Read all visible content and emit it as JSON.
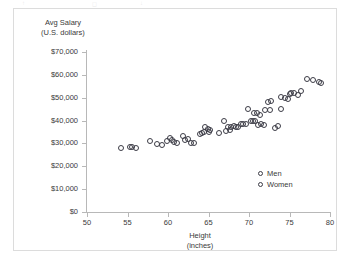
{
  "chart_data": {
    "type": "scatter",
    "title": "",
    "xlabel": "Height (inches)",
    "ylabel": "Avg Salary (U.S. dollars)",
    "xlabel_lines": [
      "Height",
      "(inches)"
    ],
    "ylabel_lines": [
      "Avg Salary",
      "(U.S. dollars)"
    ],
    "xlim": [
      50,
      80
    ],
    "ylim": [
      0,
      70000
    ],
    "xticks": [
      50,
      55,
      60,
      65,
      70,
      75,
      80
    ],
    "xtick_labels": [
      "50",
      "55",
      "60",
      "65",
      "70",
      "75",
      "80"
    ],
    "yticks": [
      0,
      10000,
      20000,
      30000,
      40000,
      50000,
      60000,
      70000
    ],
    "ytick_labels": [
      "$0",
      "$10,000",
      "$20,000",
      "$30,000",
      "$40,000",
      "$50,000",
      "$60,000",
      "$70,000"
    ],
    "grid": false,
    "legend_position": "inside-bottom-right",
    "marker_style": "open-circle",
    "marker_color": "#3c3c46",
    "series": [
      {
        "name": "Men",
        "points": [
          [
            64.6,
            37100
          ],
          [
            65.0,
            35200
          ],
          [
            66.3,
            34600
          ],
          [
            67.1,
            35600
          ],
          [
            67.6,
            36000
          ],
          [
            68.4,
            37000
          ],
          [
            68.7,
            37200
          ],
          [
            69.0,
            38400
          ],
          [
            69.3,
            38500
          ],
          [
            69.6,
            38300
          ],
          [
            69.9,
            45200
          ],
          [
            70.2,
            40000
          ],
          [
            70.5,
            39900
          ],
          [
            70.8,
            39800
          ],
          [
            71.1,
            38200
          ],
          [
            71.5,
            38300
          ],
          [
            71.9,
            38100
          ],
          [
            72.3,
            48000
          ],
          [
            72.7,
            48400
          ],
          [
            73.2,
            36900
          ],
          [
            73.6,
            37600
          ],
          [
            74.0,
            50500
          ],
          [
            74.4,
            49700
          ],
          [
            74.8,
            49400
          ],
          [
            75.2,
            52200
          ],
          [
            75.6,
            51900
          ],
          [
            76.0,
            51400
          ],
          [
            77.2,
            58200
          ],
          [
            77.9,
            57800
          ],
          [
            78.6,
            57000
          ],
          [
            78.9,
            56500
          ]
        ]
      },
      {
        "name": "Women",
        "points": [
          [
            54.2,
            28200
          ],
          [
            55.3,
            28600
          ],
          [
            55.6,
            28500
          ],
          [
            56.1,
            28100
          ],
          [
            57.8,
            31200
          ],
          [
            58.6,
            29800
          ],
          [
            59.2,
            29500
          ],
          [
            59.9,
            31000
          ],
          [
            60.2,
            32200
          ],
          [
            60.5,
            31500
          ],
          [
            60.8,
            30600
          ],
          [
            61.1,
            30400
          ],
          [
            61.8,
            33400
          ],
          [
            62.1,
            31400
          ],
          [
            62.5,
            32100
          ],
          [
            62.9,
            30100
          ],
          [
            63.2,
            30000
          ],
          [
            63.9,
            34300
          ],
          [
            64.2,
            34400
          ],
          [
            64.5,
            35100
          ],
          [
            64.9,
            36300
          ],
          [
            65.2,
            35900
          ],
          [
            66.9,
            39600
          ],
          [
            67.4,
            37300
          ],
          [
            67.8,
            37100
          ],
          [
            68.1,
            37500
          ],
          [
            70.6,
            43300
          ],
          [
            71.0,
            43400
          ],
          [
            71.3,
            42600
          ],
          [
            72.0,
            44500
          ],
          [
            72.6,
            44600
          ],
          [
            73.9,
            45200
          ],
          [
            75.0,
            51500
          ],
          [
            76.4,
            53000
          ]
        ]
      }
    ]
  },
  "legend": {
    "items": [
      {
        "label": "Men"
      },
      {
        "label": "Women"
      }
    ]
  },
  "artifacts": {
    "top": [
      "↑",
      "◻",
      "↓"
    ]
  }
}
